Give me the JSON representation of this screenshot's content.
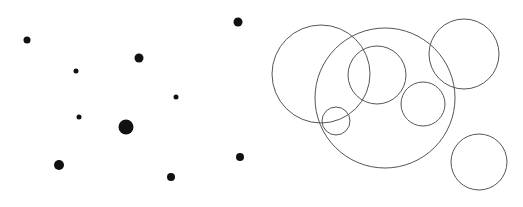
{
  "diagram": {
    "width": 523,
    "height": 207,
    "colors": {
      "background": "#ffffff",
      "dot": "#111111",
      "ring": "#555555"
    },
    "dots": [
      {
        "cx": 27,
        "cy": 40,
        "r": 3.5
      },
      {
        "cx": 76,
        "cy": 71,
        "r": 2.5
      },
      {
        "cx": 139,
        "cy": 58,
        "r": 4.5
      },
      {
        "cx": 238,
        "cy": 22,
        "r": 4.5
      },
      {
        "cx": 176,
        "cy": 97,
        "r": 2.5
      },
      {
        "cx": 79,
        "cy": 117,
        "r": 2.5
      },
      {
        "cx": 126,
        "cy": 127,
        "r": 7.5
      },
      {
        "cx": 59,
        "cy": 165,
        "r": 5
      },
      {
        "cx": 171,
        "cy": 177,
        "r": 4
      },
      {
        "cx": 240,
        "cy": 157,
        "r": 4
      }
    ],
    "circles": [
      {
        "cx": 321,
        "cy": 74,
        "r": 49
      },
      {
        "cx": 385,
        "cy": 98,
        "r": 70
      },
      {
        "cx": 377,
        "cy": 75,
        "r": 29
      },
      {
        "cx": 464,
        "cy": 54,
        "r": 35
      },
      {
        "cx": 336,
        "cy": 121,
        "r": 14
      },
      {
        "cx": 423,
        "cy": 104,
        "r": 22
      },
      {
        "cx": 479,
        "cy": 162,
        "r": 28
      }
    ]
  }
}
